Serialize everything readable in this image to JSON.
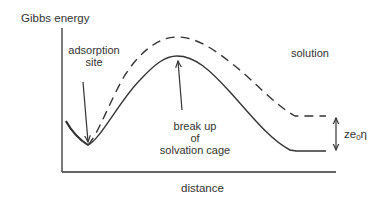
{
  "diagram": {
    "type": "energy-profile",
    "y_axis_label": "Gibbs energy",
    "x_axis_label": "distance",
    "annotations": {
      "adsorption_line1": "adsorption",
      "adsorption_line2": "site",
      "breakup_line1": "break up",
      "breakup_line2": "of",
      "breakup_line3": "solvation cage",
      "solution": "solution",
      "overpotential_prefix": "ze",
      "overpotential_sub": "0",
      "overpotential_suffix": "η"
    },
    "curves": [
      {
        "name": "solid-curve",
        "style": "solid",
        "minimum": "adsorption site",
        "maximum": "break up of solvation cage",
        "plateau": "solution (lower)"
      },
      {
        "name": "dashed-curve",
        "style": "dashed",
        "minimum": "adsorption site",
        "maximum": "higher barrier",
        "plateau": "solution (raised by ze0η)"
      }
    ],
    "colors": {
      "line": "#333333",
      "background": "#ffffff"
    }
  }
}
